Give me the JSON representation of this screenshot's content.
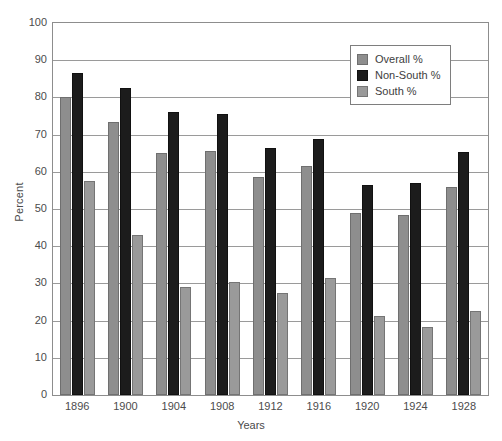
{
  "chart_data": {
    "type": "bar",
    "title": "",
    "xlabel": "Years",
    "ylabel": "Percent",
    "ylim": [
      0,
      100
    ],
    "ytick_step": 10,
    "ytick_labels": [
      "100",
      "90",
      "80",
      "70",
      "60",
      "50",
      "40",
      "30",
      "20",
      "10",
      "0"
    ],
    "grid": "horizontal",
    "legend_position": "top-right",
    "categories": [
      "1896",
      "1900",
      "1904",
      "1908",
      "1912",
      "1916",
      "1920",
      "1924",
      "1928"
    ],
    "series": [
      {
        "name": "Overall %",
        "color": "#8e8e8e",
        "values": [
          80.0,
          73.5,
          65.0,
          65.5,
          58.5,
          61.5,
          49.0,
          48.5,
          56.0
        ]
      },
      {
        "name": "Non-South %",
        "color": "#1c1c1c",
        "values": [
          86.5,
          82.5,
          76.0,
          75.5,
          66.5,
          68.7,
          56.5,
          57.0,
          65.3
        ]
      },
      {
        "name": "South %",
        "color": "#9a9a9a",
        "values": [
          57.5,
          43.0,
          29.0,
          30.5,
          27.5,
          31.5,
          21.3,
          18.3,
          22.7
        ]
      }
    ]
  },
  "legend": {
    "entries": [
      {
        "label": "Overall %"
      },
      {
        "label": "Non-South %"
      },
      {
        "label": "South %"
      }
    ]
  },
  "axes": {
    "y_title": "Percent",
    "x_title": "Years"
  },
  "caption": {
    "sliver": ""
  }
}
